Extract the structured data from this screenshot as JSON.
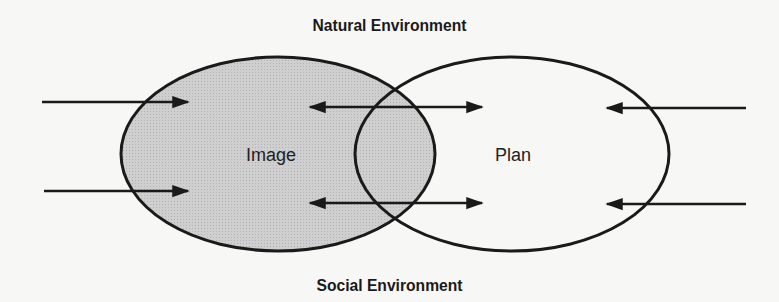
{
  "diagram": {
    "top_label": "Natural Environment",
    "bottom_label": "Social Environment",
    "nodes": [
      {
        "id": "image",
        "label": "Image",
        "fill": "#c8c8c8",
        "shaded": true
      },
      {
        "id": "plan",
        "label": "Plan",
        "fill": "#f7f7f5",
        "shaded": false
      }
    ],
    "arrows": [
      {
        "from": "left-outside",
        "to": "image",
        "direction": "right",
        "count": 2
      },
      {
        "between": [
          "image",
          "plan"
        ],
        "direction": "bidirectional",
        "count": 2
      },
      {
        "from": "right-outside",
        "to": "plan",
        "direction": "left",
        "count": 2
      }
    ],
    "colors": {
      "stroke": "#1a1a1a",
      "background": "#f7f7f5",
      "shaded_fill": "#c8c8c8"
    }
  }
}
